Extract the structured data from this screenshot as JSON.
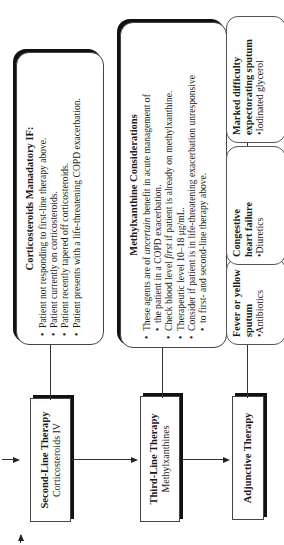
{
  "diagram": {
    "orientation": "rotated-90-counterclockwise",
    "main_flow": [
      {
        "id": "second-line",
        "title": "Second-Line Therapy",
        "subtitle": "Corticosteroids IV"
      },
      {
        "id": "third-line",
        "title": "Third-Line Therapy",
        "subtitle": "Methylxanthines"
      },
      {
        "id": "adjunctive",
        "title": "Adjunctive Therapy",
        "subtitle": ""
      }
    ],
    "corticosteroids_box": {
      "title": "Corticosteroids Manadatory IF:",
      "items": [
        "Patient not responding to first-line therapy above.",
        "Patient currently on corticosteroids.",
        "Patient recently tapered off corticosteroids.",
        "Patient presents with a life-threatening COPD exacerbation."
      ]
    },
    "methylxanthine_box": {
      "title": "Methylxanthine Considerations",
      "items": [
        {
          "pre": "These agents are of ",
          "em": "uncertain",
          "post": " benefit in acute management of"
        },
        {
          "cont": "the patient in a COPD exacerbation."
        },
        {
          "pre": "Check blood level ",
          "em": "first",
          "post": " if patient is already on methylxanthine."
        },
        {
          "pre": "Therapeutic level 10–18 μg/mL.",
          "em": "",
          "post": ""
        },
        {
          "pre": "Consider if patient is in life-threatening exacerbation unresponsive",
          "em": "",
          "post": ""
        },
        {
          "cont": "to first- and second-line therapy above."
        }
      ]
    },
    "adjunctive_options": [
      {
        "condition_line1": "Fever or yellow",
        "condition_line2": "sputum",
        "treatment": "Antibiotics"
      },
      {
        "condition_line1": "Congestive",
        "condition_line2": "heart failure",
        "treatment": "Diuretics"
      },
      {
        "condition_line1": "Marked difficulty",
        "condition_line2": "expectorating sputum",
        "treatment": "Iodinated glycerol"
      }
    ]
  }
}
